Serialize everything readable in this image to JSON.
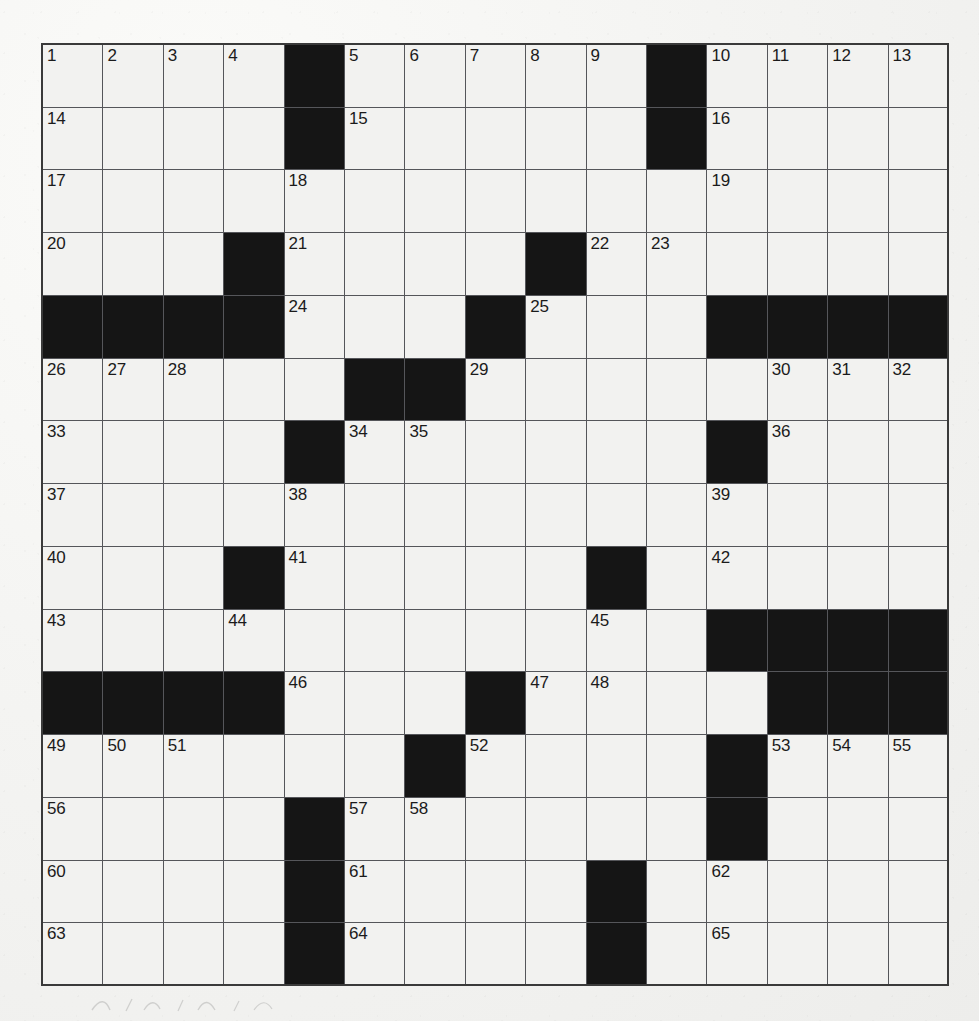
{
  "puzzle": {
    "type": "crossword-grid",
    "title": "Crossword Puzzle Grid",
    "rows": 15,
    "cols": 15,
    "colors": {
      "paper": "#f2f2f0",
      "block": "#151515",
      "rule": "#55565a",
      "frame": "#3a3a3a",
      "number": "#1b1b1b"
    },
    "numbering": {
      "first": 1,
      "last": 65,
      "count": 65
    },
    "legend": {
      "block_marker": "#",
      "open_marker": "."
    },
    "grid": [
      "....#.....#....",
      "....#.....#....",
      "...............",
      "...#....#......",
      "####...#...####",
      ".....##........",
      "....#......#...",
      "...............",
      "...#.....#.....",
      "...........####",
      "####...#....###",
      "......#....#...",
      "....#......#...",
      "....#....#.....",
      "....#....#....."
    ],
    "clue_numbers": [
      {
        "n": 1,
        "row": 1,
        "col": 1
      },
      {
        "n": 2,
        "row": 1,
        "col": 2
      },
      {
        "n": 3,
        "row": 1,
        "col": 3
      },
      {
        "n": 4,
        "row": 1,
        "col": 4
      },
      {
        "n": 5,
        "row": 1,
        "col": 6
      },
      {
        "n": 6,
        "row": 1,
        "col": 7
      },
      {
        "n": 7,
        "row": 1,
        "col": 8
      },
      {
        "n": 8,
        "row": 1,
        "col": 9
      },
      {
        "n": 9,
        "row": 1,
        "col": 10
      },
      {
        "n": 10,
        "row": 1,
        "col": 12
      },
      {
        "n": 11,
        "row": 1,
        "col": 13
      },
      {
        "n": 12,
        "row": 1,
        "col": 14
      },
      {
        "n": 13,
        "row": 1,
        "col": 15
      },
      {
        "n": 14,
        "row": 2,
        "col": 1
      },
      {
        "n": 15,
        "row": 2,
        "col": 6
      },
      {
        "n": 16,
        "row": 2,
        "col": 12
      },
      {
        "n": 17,
        "row": 3,
        "col": 1
      },
      {
        "n": 18,
        "row": 3,
        "col": 5
      },
      {
        "n": 19,
        "row": 3,
        "col": 12
      },
      {
        "n": 20,
        "row": 4,
        "col": 1
      },
      {
        "n": 21,
        "row": 4,
        "col": 5
      },
      {
        "n": 22,
        "row": 4,
        "col": 10
      },
      {
        "n": 23,
        "row": 4,
        "col": 11
      },
      {
        "n": 24,
        "row": 5,
        "col": 5
      },
      {
        "n": 25,
        "row": 5,
        "col": 9
      },
      {
        "n": 26,
        "row": 6,
        "col": 1
      },
      {
        "n": 27,
        "row": 6,
        "col": 2
      },
      {
        "n": 28,
        "row": 6,
        "col": 3
      },
      {
        "n": 29,
        "row": 6,
        "col": 8
      },
      {
        "n": 30,
        "row": 6,
        "col": 13
      },
      {
        "n": 31,
        "row": 6,
        "col": 14
      },
      {
        "n": 32,
        "row": 6,
        "col": 15
      },
      {
        "n": 33,
        "row": 7,
        "col": 1
      },
      {
        "n": 34,
        "row": 7,
        "col": 6
      },
      {
        "n": 35,
        "row": 7,
        "col": 7
      },
      {
        "n": 36,
        "row": 7,
        "col": 13
      },
      {
        "n": 37,
        "row": 8,
        "col": 1
      },
      {
        "n": 38,
        "row": 8,
        "col": 5
      },
      {
        "n": 39,
        "row": 8,
        "col": 12
      },
      {
        "n": 40,
        "row": 9,
        "col": 1
      },
      {
        "n": 41,
        "row": 9,
        "col": 5
      },
      {
        "n": 42,
        "row": 9,
        "col": 12
      },
      {
        "n": 43,
        "row": 10,
        "col": 1
      },
      {
        "n": 44,
        "row": 10,
        "col": 4
      },
      {
        "n": 45,
        "row": 10,
        "col": 10
      },
      {
        "n": 46,
        "row": 11,
        "col": 5
      },
      {
        "n": 47,
        "row": 11,
        "col": 9
      },
      {
        "n": 48,
        "row": 11,
        "col": 10
      },
      {
        "n": 49,
        "row": 12,
        "col": 1
      },
      {
        "n": 50,
        "row": 12,
        "col": 2
      },
      {
        "n": 51,
        "row": 12,
        "col": 3
      },
      {
        "n": 52,
        "row": 12,
        "col": 8
      },
      {
        "n": 53,
        "row": 12,
        "col": 13
      },
      {
        "n": 54,
        "row": 12,
        "col": 14
      },
      {
        "n": 55,
        "row": 12,
        "col": 15
      },
      {
        "n": 56,
        "row": 13,
        "col": 1
      },
      {
        "n": 57,
        "row": 13,
        "col": 6
      },
      {
        "n": 58,
        "row": 13,
        "col": 7
      },
      {
        "n": 59,
        "row": 13,
        "col": 12
      },
      {
        "n": 60,
        "row": 14,
        "col": 1
      },
      {
        "n": 61,
        "row": 14,
        "col": 6
      },
      {
        "n": 62,
        "row": 14,
        "col": 12
      },
      {
        "n": 63,
        "row": 15,
        "col": 1
      },
      {
        "n": 64,
        "row": 15,
        "col": 6
      },
      {
        "n": 65,
        "row": 15,
        "col": 12
      }
    ]
  }
}
